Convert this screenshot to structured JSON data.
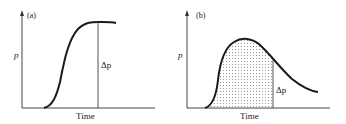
{
  "panels": [
    {
      "id": "a",
      "label": "(a)",
      "ylabel": "p",
      "xlabel": "Time",
      "delta_label": "Δp",
      "description": "Sigmoid rise of p with time to a plateau; vertical line marks Δp from baseline to plateau"
    },
    {
      "id": "b",
      "label": "(b)",
      "ylabel": "p",
      "xlabel": "Time",
      "delta_label": "Δp",
      "description": "p rises to a peak then decays; dotted shaded area under curve up to vertical line; Δp marked at the vertical line"
    }
  ],
  "colors": {
    "ink": "#1a1a1a",
    "axis": "#555555",
    "shade_dot": "#666666"
  }
}
